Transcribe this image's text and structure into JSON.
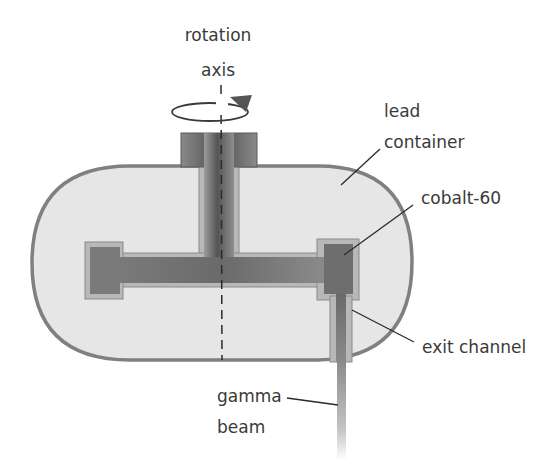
{
  "diagram": {
    "labels": {
      "rotation_axis_line1": "rotation",
      "rotation_axis_line2": "axis",
      "lead_container_line1": "lead",
      "lead_container_line2": "container",
      "cobalt": "cobalt-60",
      "exit_channel": "exit channel",
      "gamma_beam_line1": "gamma",
      "gamma_beam_line2": "beam"
    },
    "colors": {
      "lead_fill": "#e6e6e6",
      "lead_outline": "#808080",
      "shaft_dark": "#5a5a5a",
      "shaft_light": "#9a9a9a",
      "cobalt_fill": "#6e6e6e",
      "lining": "#b5b5b5",
      "text": "#3a3a3a",
      "leader": "#2a2a2a"
    }
  }
}
